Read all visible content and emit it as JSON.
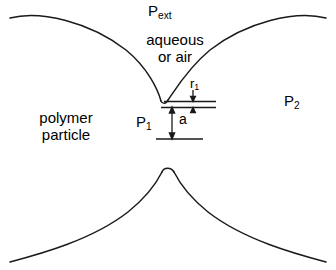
{
  "figure": {
    "background": "#ffffff",
    "stroke_color": "#1a1a1a",
    "width": 336,
    "height": 270,
    "labels": {
      "external_pressure": "P",
      "external_pressure_sub": "ext",
      "medium_line1": "aqueous",
      "medium_line2": "or air",
      "particle_line1": "polymer",
      "particle_line2": "particle",
      "pressure_inner": "P",
      "pressure_inner_sub": "1",
      "pressure_outer": "P",
      "pressure_outer_sub": "2",
      "radius": "r",
      "radius_sub": "1",
      "gap": "a"
    }
  }
}
